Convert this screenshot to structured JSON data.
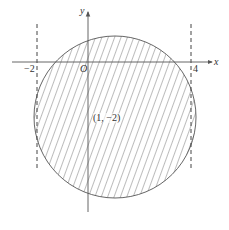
{
  "diagram": {
    "type": "coordinate-region",
    "axes": {
      "x_label": "x",
      "y_label": "y",
      "origin_label": "O"
    },
    "tick_labels": {
      "left": "−2",
      "right": "4"
    },
    "center_label": "(1, −2)",
    "circle": {
      "center": [
        1,
        -2
      ],
      "shaded": true,
      "hatch": "diagonal"
    },
    "dashed_lines": [
      {
        "equation": "x = -2"
      },
      {
        "equation": "x = 4"
      }
    ],
    "colors": {
      "stroke": "#555555",
      "hatch": "#6a6a6a",
      "background": "#ffffff"
    }
  }
}
